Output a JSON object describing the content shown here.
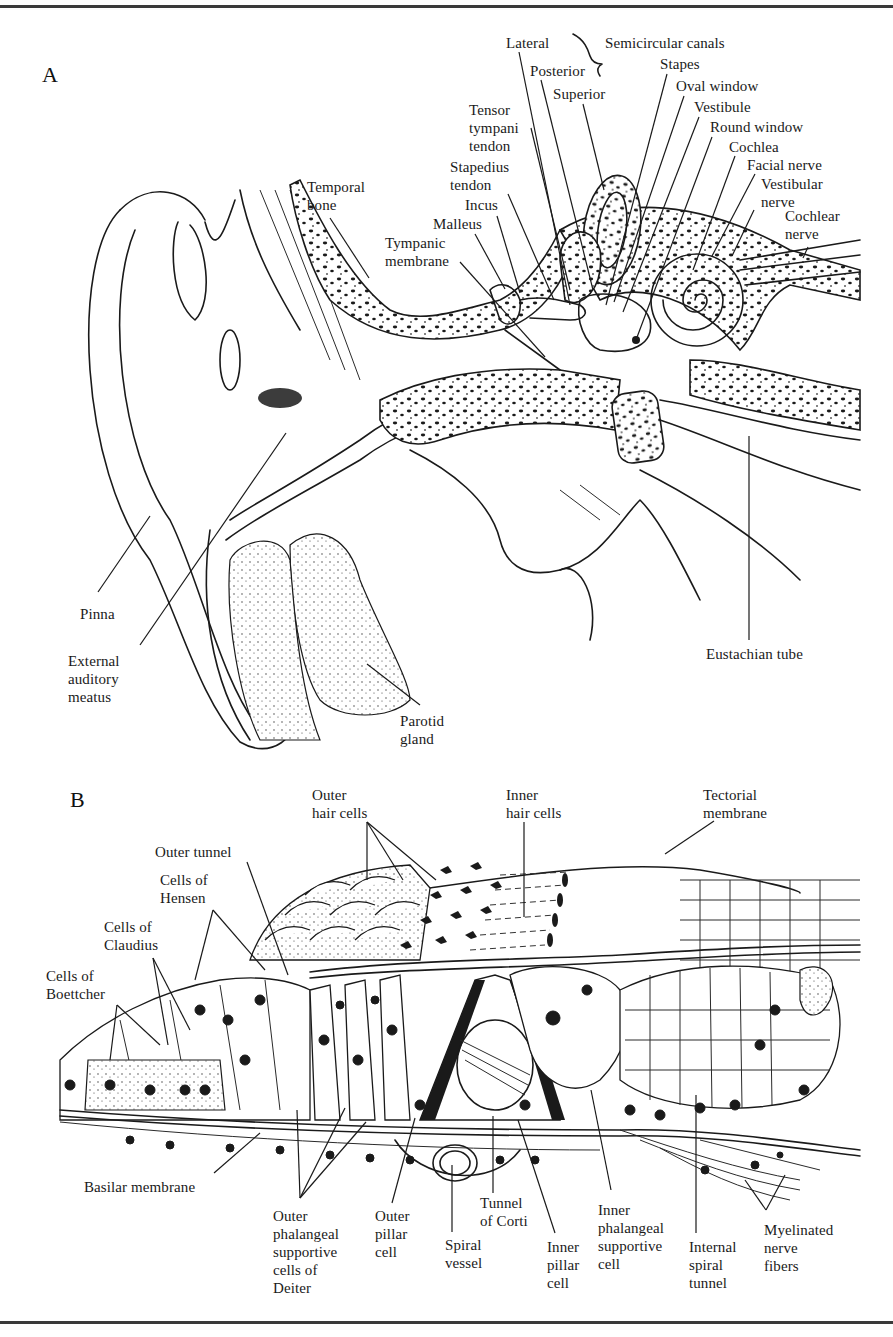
{
  "figure": {
    "panels": [
      {
        "letter": "A",
        "title": "Ear cross-section",
        "labels": [
          {
            "id": "lateral",
            "text": "Lateral",
            "x": 506,
            "y": 34,
            "leader": [
              [
                519,
                52
              ],
              [
                570,
                305
              ]
            ]
          },
          {
            "id": "semicircular-canals",
            "text": "Semicircular canals",
            "x": 605,
            "y": 34,
            "brace": true
          },
          {
            "id": "posterior",
            "text": "Posterior",
            "x": 530,
            "y": 62,
            "leader": [
              [
                541,
                80
              ],
              [
                593,
                290
              ]
            ]
          },
          {
            "id": "stapes",
            "text": "Stapes",
            "x": 660,
            "y": 55,
            "leader": [
              [
                667,
                74
              ],
              [
                606,
                305
              ]
            ]
          },
          {
            "id": "superior",
            "text": "Superior",
            "x": 553,
            "y": 85,
            "leader": [
              [
                583,
                104
              ],
              [
                604,
                190
              ]
            ]
          },
          {
            "id": "oval-window",
            "text": "Oval window",
            "x": 676,
            "y": 77,
            "leader": [
              [
                684,
                96
              ],
              [
                614,
                302
              ]
            ]
          },
          {
            "id": "tensor-tympani-tendon",
            "text": "Tensor\ntympani\ntendon",
            "x": 469,
            "y": 101,
            "leader": [
              [
                531,
                128
              ],
              [
                570,
                290
              ]
            ]
          },
          {
            "id": "vestibule",
            "text": "Vestibule",
            "x": 694,
            "y": 98,
            "leader": [
              [
                699,
                117
              ],
              [
                623,
                312
              ]
            ]
          },
          {
            "id": "round-window",
            "text": "Round window",
            "x": 710,
            "y": 118,
            "leader": [
              [
                712,
                137
              ],
              [
                636,
                340
              ]
            ]
          },
          {
            "id": "cochlea",
            "text": "Cochlea",
            "x": 729,
            "y": 138,
            "leader": [
              [
                735,
                156
              ],
              [
                693,
                270
              ]
            ]
          },
          {
            "id": "facial-nerve",
            "text": "Facial nerve",
            "x": 747,
            "y": 156,
            "leader": [
              [
                755,
                174
              ],
              [
                712,
                256
              ]
            ]
          },
          {
            "id": "temporal-bone",
            "text": "Temporal\nbone",
            "x": 307,
            "y": 178,
            "leader": [
              [
                330,
                218
              ],
              [
                369,
                278
              ]
            ]
          },
          {
            "id": "stapedius-tendon",
            "text": "Stapedius\ntendon",
            "x": 450,
            "y": 158,
            "leader": [
              [
                508,
                194
              ],
              [
                554,
                300
              ]
            ]
          },
          {
            "id": "vestibular-nerve",
            "text": "Vestibular\nnerve",
            "x": 761,
            "y": 175,
            "leader": [
              [
                754,
                210
              ],
              [
                732,
                256
              ]
            ]
          },
          {
            "id": "incus",
            "text": "Incus",
            "x": 465,
            "y": 196,
            "leader": [
              [
                497,
                216
              ],
              [
                520,
                293
              ]
            ]
          },
          {
            "id": "cochlear-nerve",
            "text": "Cochlear\nnerve",
            "x": 785,
            "y": 207,
            "leader": [
              [
                808,
                247
              ],
              [
                803,
                258
              ]
            ]
          },
          {
            "id": "malleus",
            "text": "Malleus",
            "x": 433,
            "y": 215,
            "leader": [
              [
                475,
                234
              ],
              [
                505,
                289
              ]
            ]
          },
          {
            "id": "tympanic-membrane",
            "text": "Tympanic\nmembrane",
            "x": 385,
            "y": 234,
            "leader": [
              [
                460,
                262
              ],
              [
                545,
                357
              ]
            ]
          },
          {
            "id": "pinna",
            "text": "Pinna",
            "x": 80,
            "y": 605,
            "leader": [
              [
                98,
                592
              ],
              [
                150,
                516
              ]
            ]
          },
          {
            "id": "external-auditory-meatus",
            "text": "External\nauditory\nmeatus",
            "x": 68,
            "y": 652,
            "leader": [
              [
                140,
                645
              ],
              [
                286,
                433
              ]
            ]
          },
          {
            "id": "parotid-gland",
            "text": "Parotid\ngland",
            "x": 400,
            "y": 712,
            "leader": [
              [
                420,
                705
              ],
              [
                367,
                664
              ]
            ]
          },
          {
            "id": "eustachian-tube",
            "text": "Eustachian tube",
            "x": 706,
            "y": 645,
            "leader": [
              [
                749,
                640
              ],
              [
                749,
                436
              ]
            ]
          }
        ]
      },
      {
        "letter": "B",
        "title": "Organ of Corti",
        "labels": [
          {
            "id": "outer-hair-cells",
            "text": "Outer\nhair cells",
            "x": 312,
            "y": 786,
            "leaders": [
              [
                [
                  367,
                  822
                ],
                [
                  367,
                  880
                ]
              ],
              [
                [
                  367,
                  822
                ],
                [
                  403,
                  880
                ]
              ],
              [
                [
                  367,
                  822
                ],
                [
                  436,
                  880
                ]
              ]
            ]
          },
          {
            "id": "inner-hair-cells",
            "text": "Inner\nhair cells",
            "x": 506,
            "y": 786,
            "leader": [
              [
                524,
                822
              ],
              [
                524,
                917
              ]
            ]
          },
          {
            "id": "tectorial-membrane",
            "text": "Tectorial\nmembrane",
            "x": 703,
            "y": 786,
            "leader": [
              [
                714,
                821
              ],
              [
                665,
                854
              ]
            ]
          },
          {
            "id": "outer-tunnel",
            "text": "Outer tunnel",
            "x": 155,
            "y": 843,
            "leader": [
              [
                247,
                862
              ],
              [
                288,
                975
              ]
            ]
          },
          {
            "id": "cells-of-hensen",
            "text": "Cells of\nHensen",
            "x": 160,
            "y": 871,
            "leaders": [
              [
                [
                  213,
                  910
                ],
                [
                  195,
                  980
                ]
              ],
              [
                [
                  213,
                  910
                ],
                [
                  265,
                  970
                ]
              ]
            ]
          },
          {
            "id": "cells-of-claudius",
            "text": "Cells of\nClaudius",
            "x": 104,
            "y": 918,
            "leaders": [
              [
                [
                  153,
                  958
                ],
                [
                  168,
                  1045
                ]
              ],
              [
                [
                  153,
                  958
                ],
                [
                  190,
                  1030
                ]
              ]
            ]
          },
          {
            "id": "cells-of-boettcher",
            "text": "Cells of\nBoettcher",
            "x": 46,
            "y": 967,
            "leaders": [
              [
                [
                  117,
                  1005
                ],
                [
                  110,
                  1060
                ]
              ],
              [
                [
                  117,
                  1005
                ],
                [
                  160,
                  1045
                ]
              ]
            ]
          },
          {
            "id": "basilar-membrane",
            "text": "Basilar membrane",
            "x": 84,
            "y": 1178,
            "leader": [
              [
                214,
                1173
              ],
              [
                260,
                1133
              ]
            ]
          },
          {
            "id": "outer-phalangeal-supportive-cells",
            "text": "Outer\nphalangeal\nsupportive\ncells of\nDeiter",
            "x": 273,
            "y": 1207,
            "leaders": [
              [
                [
                  300,
                  1198
                ],
                [
                  297,
                  1110
                ]
              ],
              [
                [
                  300,
                  1198
                ],
                [
                  345,
                  1108
                ]
              ],
              [
                [
                  300,
                  1198
                ],
                [
                  366,
                  1122
                ]
              ]
            ]
          },
          {
            "id": "outer-pillar-cell",
            "text": "Outer\npillar\ncell",
            "x": 375,
            "y": 1207,
            "leader": [
              [
                392,
                1203
              ],
              [
                415,
                1118
              ]
            ]
          },
          {
            "id": "tunnel-of-corti",
            "text": "Tunnel\nof Corti",
            "x": 480,
            "y": 1194,
            "leader": [
              [
                493,
                1193
              ],
              [
                493,
                1116
              ]
            ]
          },
          {
            "id": "spiral-vessel",
            "text": "Spiral\nvessel",
            "x": 445,
            "y": 1236,
            "leader": [
              [
                452,
                1232
              ],
              [
                452,
                1165
              ]
            ]
          },
          {
            "id": "inner-pillar-cell",
            "text": "Inner\npillar\ncell",
            "x": 547,
            "y": 1238,
            "leader": [
              [
                555,
                1233
              ],
              [
                518,
                1120
              ]
            ]
          },
          {
            "id": "inner-phalangeal-supportive-cell",
            "text": "Inner\nphalangeal\nsupportive\ncell",
            "x": 598,
            "y": 1201,
            "leader": [
              [
                611,
                1190
              ],
              [
                591,
                1090
              ]
            ]
          },
          {
            "id": "internal-spiral-tunnel",
            "text": "Internal\nspiral\ntunnel",
            "x": 689,
            "y": 1238,
            "leader": [
              [
                696,
                1233
              ],
              [
                696,
                1095
              ]
            ]
          },
          {
            "id": "myelinated-nerve-fibers",
            "text": "Myelinated\nnerve\nfibers",
            "x": 764,
            "y": 1221,
            "leaders": [
              [
                [
                  766,
                  1210
                ],
                [
                  745,
                  1180
                ]
              ],
              [
                [
                  766,
                  1210
                ],
                [
                  785,
                  1175
                ]
              ]
            ]
          }
        ]
      }
    ]
  }
}
